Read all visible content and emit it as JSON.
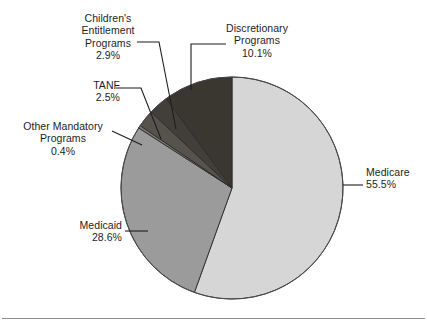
{
  "figure": {
    "background": "#ffffff",
    "has_bottom_rule": true
  },
  "chart_data": {
    "type": "pie",
    "title": "",
    "subtitle": "",
    "xlabel": "",
    "ylabel": "",
    "legend_position": "none",
    "labels_position": "callout-leader-lines",
    "start_angle_deg": 0,
    "direction": "clockwise",
    "units": "percent",
    "categories": [
      "Medicare",
      "Medicaid",
      "Other Mandatory Programs",
      "TANF",
      "Children's Entitlement Programs",
      "Discretionary Programs"
    ],
    "values": [
      55.5,
      28.6,
      0.4,
      2.5,
      2.9,
      10.1
    ],
    "value_labels": [
      "55.5%",
      "28.6%",
      "0.4%",
      "2.5%",
      "2.9%",
      "10.1%"
    ],
    "colors": [
      "#d6d6d6",
      "#9b9b9b",
      "#7b7870",
      "#56534d",
      "#423f39",
      "#3a3731"
    ],
    "slices": [
      {
        "name": "Medicare",
        "value": 55.5,
        "value_label": "55.5%",
        "color": "#d6d6d6"
      },
      {
        "name": "Medicaid",
        "value": 28.6,
        "value_label": "28.6%",
        "color": "#9b9b9b"
      },
      {
        "name": "Other Mandatory Programs",
        "value": 0.4,
        "value_label": "0.4%",
        "color": "#7b7870"
      },
      {
        "name": "TANF",
        "value": 2.5,
        "value_label": "2.5%",
        "color": "#56534d"
      },
      {
        "name": "Children's Entitlement Programs",
        "value": 2.9,
        "value_label": "2.9%",
        "color": "#423f39"
      },
      {
        "name": "Discretionary Programs",
        "value": 10.1,
        "value_label": "10.1%",
        "color": "#3a3731"
      }
    ]
  },
  "labels": {
    "children": {
      "line1": "Children's",
      "line2": "Entitlement",
      "line3": "Programs",
      "value": "2.9%"
    },
    "tanf": {
      "line1": "TANF",
      "value": "2.5%"
    },
    "other_mandatory": {
      "line1": "Other Mandatory",
      "line2": "Programs",
      "value": "0.4%"
    },
    "discretionary": {
      "line1": "Discretionary",
      "line2": "Programs",
      "value": "10.1%"
    },
    "medicare": {
      "line1": "Medicare",
      "value": "55.5%"
    },
    "medicaid": {
      "line1": "Medicaid",
      "value": "28.6%"
    }
  }
}
